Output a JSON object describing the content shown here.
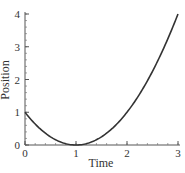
{
  "chart_data": {
    "type": "line",
    "title": "",
    "xlabel": "Time",
    "ylabel": "Position",
    "xlim": [
      0,
      3
    ],
    "ylim": [
      0,
      4
    ],
    "x_ticks": [
      "0",
      "1",
      "2",
      "3"
    ],
    "y_ticks": [
      "0",
      "1",
      "2",
      "3",
      "4"
    ],
    "grid": false,
    "legend": null,
    "series": [
      {
        "name": "position",
        "function": "(t-1)^2",
        "x": [
          0,
          0.25,
          0.5,
          0.75,
          1,
          1.25,
          1.5,
          1.75,
          2,
          2.25,
          2.5,
          2.75,
          3
        ],
        "y": [
          1,
          0.5625,
          0.25,
          0.0625,
          0,
          0.0625,
          0.25,
          0.5625,
          1,
          1.5625,
          2.25,
          3.0625,
          4
        ],
        "color": "#333333"
      }
    ]
  }
}
